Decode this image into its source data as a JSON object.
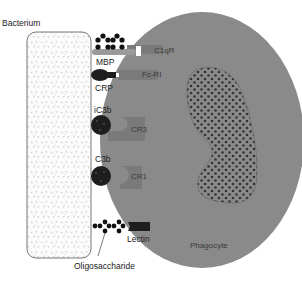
{
  "labels": {
    "bacterium": "Bacterium",
    "phagocyte": "Phagocyte",
    "oligosaccharide": "Oligosaccharide"
  },
  "opsonins": [
    {
      "name": "MBP",
      "receptor": "C1qR"
    },
    {
      "name": "CRP",
      "receptor": "Fc-RI"
    },
    {
      "name": "iC3b",
      "receptor": "CR3"
    },
    {
      "name": "C3b",
      "receptor": "CR1"
    },
    {
      "name": "Lectin",
      "receptor": ""
    }
  ],
  "colors": {
    "phagocyte": "#8a8a8a",
    "nucleus_dots": "#3a3a3a",
    "receptor": "#7a7a7a",
    "opsonin_dark": "#1e1e1e",
    "bacterium_border": "#777777"
  }
}
